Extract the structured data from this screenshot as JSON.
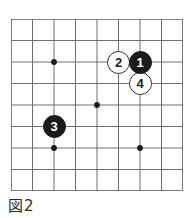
{
  "figure": {
    "caption": "図2",
    "caption_parts": {
      "label": "図",
      "number": "2"
    },
    "kind": "go-board-diagram"
  },
  "board": {
    "size": 9,
    "columns": 9,
    "rows": 9,
    "line_color": "#6e6e6e",
    "border_color": "#5a5a5a",
    "background_color": "#ffffff",
    "origin_x": 11,
    "origin_y": 19,
    "cell_px": 21.5,
    "star_point_color": "#1a1a1a",
    "star_points": [
      {
        "name": "hoshi-top-left",
        "col": 3,
        "row": 3
      },
      {
        "name": "hoshi-center",
        "col": 5,
        "row": 5
      },
      {
        "name": "hoshi-bottom-left",
        "col": 3,
        "row": 7
      },
      {
        "name": "hoshi-bottom-right",
        "col": 7,
        "row": 7
      }
    ]
  },
  "stones": [
    {
      "name": "stone-move-2-white",
      "label": "2",
      "color": "white",
      "color_hex": "#ffffff",
      "col": 6,
      "row": 3,
      "diameter": 23,
      "font_size": 13
    },
    {
      "name": "stone-move-1-black",
      "label": "1",
      "color": "black",
      "color_hex": "#1a1a1a",
      "col": 7,
      "row": 3,
      "diameter": 23,
      "font_size": 13
    },
    {
      "name": "stone-move-4-white",
      "label": "4",
      "color": "white",
      "color_hex": "#ffffff",
      "col": 7,
      "row": 4,
      "diameter": 23,
      "font_size": 13
    },
    {
      "name": "stone-move-3-black",
      "label": "3",
      "color": "black",
      "color_hex": "#1a1a1a",
      "col": 3,
      "row": 6,
      "diameter": 23,
      "font_size": 13
    }
  ]
}
